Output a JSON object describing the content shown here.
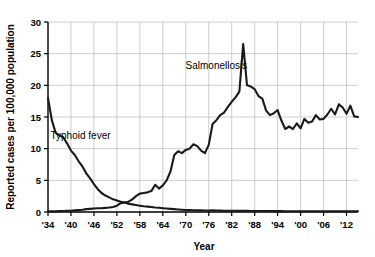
{
  "chart_data": {
    "type": "line",
    "title": "",
    "xlabel": "Year",
    "ylabel": "Reported cases per 100,000 population",
    "xlim": [
      1934,
      2015
    ],
    "ylim": [
      0,
      30
    ],
    "yticks": [
      0,
      5,
      10,
      15,
      20,
      25,
      30
    ],
    "ytick_labels": [
      "0",
      "5",
      "10",
      "15",
      "20",
      "25",
      "30"
    ],
    "xticks": [
      1934,
      1940,
      1946,
      1952,
      1958,
      1964,
      1970,
      1976,
      1982,
      1988,
      1994,
      2000,
      2006,
      2012
    ],
    "xtick_labels": [
      "'34",
      "'40",
      "'46",
      "'52",
      "'58",
      "'64",
      "'70",
      "'76",
      "'82",
      "'88",
      "'94",
      "'00",
      "'06",
      "'12"
    ],
    "grid": true,
    "legend": "none",
    "annotations": [
      {
        "name": "salmonellosis-label",
        "text": "Salmonellosis",
        "x": 1978,
        "y": 22.6
      },
      {
        "name": "typhoid-label",
        "text": "Typhoid fever",
        "x": 1942.5,
        "y": 11.6
      }
    ],
    "series": [
      {
        "name": "Salmonellosis",
        "color": "#1a1a1a",
        "x": [
          1934,
          1935,
          1936,
          1937,
          1938,
          1939,
          1940,
          1941,
          1942,
          1943,
          1944,
          1945,
          1946,
          1947,
          1948,
          1949,
          1950,
          1951,
          1952,
          1953,
          1954,
          1955,
          1956,
          1957,
          1958,
          1959,
          1960,
          1961,
          1962,
          1963,
          1964,
          1965,
          1966,
          1967,
          1968,
          1969,
          1970,
          1971,
          1972,
          1973,
          1974,
          1975,
          1976,
          1977,
          1978,
          1979,
          1980,
          1981,
          1982,
          1983,
          1984,
          1985,
          1986,
          1987,
          1988,
          1989,
          1990,
          1991,
          1992,
          1993,
          1994,
          1995,
          1996,
          1997,
          1998,
          1999,
          2000,
          2001,
          2002,
          2003,
          2004,
          2005,
          2006,
          2007,
          2008,
          2009,
          2010,
          2011,
          2012,
          2013,
          2014,
          2015
        ],
        "values": [
          0.1,
          0.1,
          0.1,
          0.15,
          0.15,
          0.2,
          0.2,
          0.25,
          0.3,
          0.35,
          0.45,
          0.5,
          0.55,
          0.6,
          0.6,
          0.65,
          0.7,
          0.8,
          1.0,
          1.4,
          1.5,
          1.6,
          2.0,
          2.5,
          2.9,
          3.0,
          3.1,
          3.3,
          4.3,
          3.7,
          4.2,
          5.0,
          6.4,
          9.0,
          9.6,
          9.3,
          9.8,
          10.0,
          10.7,
          10.4,
          9.7,
          9.3,
          10.6,
          13.9,
          14.5,
          15.3,
          15.7,
          16.6,
          17.4,
          18.1,
          19.0,
          26.5,
          20.0,
          19.8,
          19.4,
          18.3,
          17.9,
          16.0,
          15.3,
          15.6,
          16.1,
          14.4,
          13.1,
          13.5,
          13.1,
          14.0,
          13.2,
          14.7,
          14.1,
          14.3,
          15.3,
          14.6,
          14.7,
          15.4,
          16.3,
          15.4,
          17.0,
          16.5,
          15.5,
          16.8,
          15.1,
          15.0
        ]
      },
      {
        "name": "Typhoid fever",
        "color": "#1a1a1a",
        "x": [
          1934,
          1935,
          1936,
          1937,
          1938,
          1939,
          1940,
          1941,
          1942,
          1943,
          1944,
          1945,
          1946,
          1947,
          1948,
          1949,
          1950,
          1951,
          1952,
          1953,
          1954,
          1955,
          1956,
          1957,
          1958,
          1959,
          1960,
          1961,
          1962,
          1963,
          1964,
          1965,
          1966,
          1967,
          1968,
          1969,
          1970,
          1971,
          1972,
          1973,
          1974,
          1975,
          1976,
          1977,
          1978,
          1979,
          1980,
          1981,
          1982,
          1983,
          1984,
          1985,
          1986,
          1987,
          1988,
          1989,
          1990,
          1991,
          1992,
          1993,
          1994,
          1995,
          1996,
          1997,
          1998,
          1999,
          2000,
          2001,
          2002,
          2003,
          2004,
          2005,
          2006,
          2007,
          2008,
          2009,
          2010,
          2011,
          2012,
          2013,
          2014,
          2015
        ],
        "values": [
          18.0,
          14.5,
          12.5,
          12.1,
          11.8,
          10.8,
          9.7,
          9.0,
          8.0,
          7.2,
          6.1,
          5.3,
          4.4,
          3.6,
          3.0,
          2.6,
          2.3,
          2.0,
          1.8,
          1.6,
          1.5,
          1.3,
          1.2,
          1.1,
          1.0,
          0.9,
          0.85,
          0.8,
          0.72,
          0.66,
          0.6,
          0.55,
          0.5,
          0.45,
          0.4,
          0.36,
          0.32,
          0.3,
          0.28,
          0.26,
          0.25,
          0.23,
          0.22,
          0.28,
          0.24,
          0.22,
          0.2,
          0.2,
          0.19,
          0.18,
          0.18,
          0.17,
          0.17,
          0.16,
          0.16,
          0.16,
          0.15,
          0.15,
          0.15,
          0.14,
          0.14,
          0.14,
          0.13,
          0.13,
          0.13,
          0.13,
          0.12,
          0.12,
          0.12,
          0.12,
          0.12,
          0.12,
          0.12,
          0.12,
          0.12,
          0.11,
          0.11,
          0.11,
          0.11,
          0.11,
          0.11,
          0.11
        ]
      }
    ]
  }
}
